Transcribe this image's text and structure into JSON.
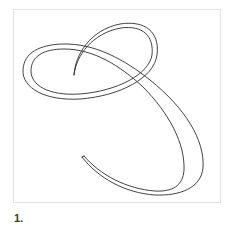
{
  "figure": {
    "caption": "1.",
    "frame_border_color": "#e2e2e2",
    "stroke_color": "#2e2e2e",
    "illustration": "outlined-calligraphic-flourish-stroke"
  }
}
